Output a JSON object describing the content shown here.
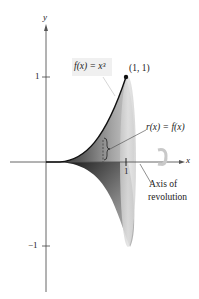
{
  "figure": {
    "axes": {
      "x_label": "x",
      "y_label": "y",
      "y_tick_pos": "1",
      "y_tick_neg": "−1",
      "x_tick": "1"
    },
    "labels": {
      "function": "f(x) = x³",
      "point": "(1, 1)",
      "radius": "r(x) = f(x)",
      "axis_line1": "Axis of",
      "axis_line2": "revolution"
    },
    "colors": {
      "curve": "#111111",
      "solid_dark": "#3a3a3a",
      "solid_mid": "#8a8a8a",
      "solid_light": "#d6d6d6",
      "disk_face": "#e4e4e4",
      "axis": "#555555"
    }
  }
}
